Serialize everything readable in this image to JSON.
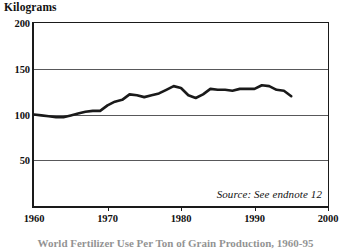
{
  "chart_data": {
    "type": "line",
    "title": "",
    "ylabel": "Kilograms",
    "xlabel": "",
    "xlim": [
      1960,
      2000
    ],
    "ylim": [
      0,
      200
    ],
    "y_ticks": [
      50,
      100,
      150,
      200
    ],
    "x_ticks": [
      1960,
      1970,
      1980,
      1990,
      2000
    ],
    "grid": "horizontal",
    "legend": "none",
    "source_note": "Source: See endnote 12",
    "caption": "World Fertilizer Use Per Ton of Grain Production, 1960-95",
    "line_color": "#1a1a1a",
    "series": [
      {
        "name": "Fertilizer use per ton of grain",
        "x": [
          1960,
          1961,
          1962,
          1963,
          1964,
          1965,
          1966,
          1967,
          1968,
          1969,
          1970,
          1971,
          1972,
          1973,
          1974,
          1975,
          1976,
          1977,
          1978,
          1979,
          1980,
          1981,
          1982,
          1983,
          1984,
          1985,
          1986,
          1987,
          1988,
          1989,
          1990,
          1991,
          1992,
          1993,
          1994,
          1995
        ],
        "values": [
          100,
          99,
          98,
          97,
          97,
          99,
          101,
          103,
          104,
          104,
          110,
          114,
          116,
          122,
          121,
          119,
          121,
          123,
          127,
          131,
          129,
          121,
          118,
          122,
          128,
          127,
          127,
          126,
          128,
          128,
          128,
          132,
          131,
          127,
          126,
          120
        ]
      }
    ]
  },
  "axis_labels": {
    "y": [
      "200",
      "150",
      "100",
      "50"
    ],
    "x": [
      "1960",
      "1970",
      "1980",
      "1990",
      "2000"
    ]
  }
}
